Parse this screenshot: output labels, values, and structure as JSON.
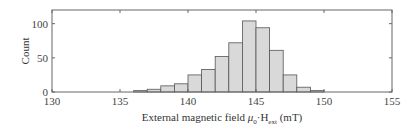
{
  "chart_data": {
    "type": "bar",
    "subtype": "histogram",
    "title": "",
    "xlabel": "External magnetic field μ0·Hext (mT)",
    "xlabel_parts": {
      "prefix": "External magnetic field ",
      "mu": "μ",
      "mu_sub": "0",
      "dot": "·H",
      "h_sub": "ext",
      "suffix": " (mT)"
    },
    "ylabel": "Count",
    "xlim": [
      130,
      155
    ],
    "ylim": [
      0,
      120
    ],
    "xticks": [
      130,
      135,
      140,
      145,
      150,
      155
    ],
    "yticks": [
      0,
      50,
      100
    ],
    "grid": false,
    "legend": null,
    "bin_width": 1,
    "bins": [
      {
        "start": 136,
        "end": 137,
        "count": 2
      },
      {
        "start": 137,
        "end": 138,
        "count": 4
      },
      {
        "start": 138,
        "end": 139,
        "count": 9
      },
      {
        "start": 139,
        "end": 140,
        "count": 12
      },
      {
        "start": 140,
        "end": 141,
        "count": 25
      },
      {
        "start": 141,
        "end": 142,
        "count": 33
      },
      {
        "start": 142,
        "end": 143,
        "count": 52
      },
      {
        "start": 143,
        "end": 144,
        "count": 72
      },
      {
        "start": 144,
        "end": 145,
        "count": 104
      },
      {
        "start": 145,
        "end": 146,
        "count": 94
      },
      {
        "start": 146,
        "end": 147,
        "count": 61
      },
      {
        "start": 147,
        "end": 148,
        "count": 25
      },
      {
        "start": 148,
        "end": 149,
        "count": 7
      },
      {
        "start": 149,
        "end": 150,
        "count": 2
      }
    ],
    "categories": [
      "136",
      "137",
      "138",
      "139",
      "140",
      "141",
      "142",
      "143",
      "144",
      "145",
      "146",
      "147",
      "148",
      "149"
    ],
    "values": [
      2,
      4,
      9,
      12,
      25,
      33,
      52,
      72,
      104,
      94,
      61,
      25,
      7,
      2
    ]
  },
  "style": {
    "bar_fill": "#d9d9d9",
    "bar_stroke": "#555555",
    "axis_color": "#666666",
    "text_color": "#444444"
  }
}
